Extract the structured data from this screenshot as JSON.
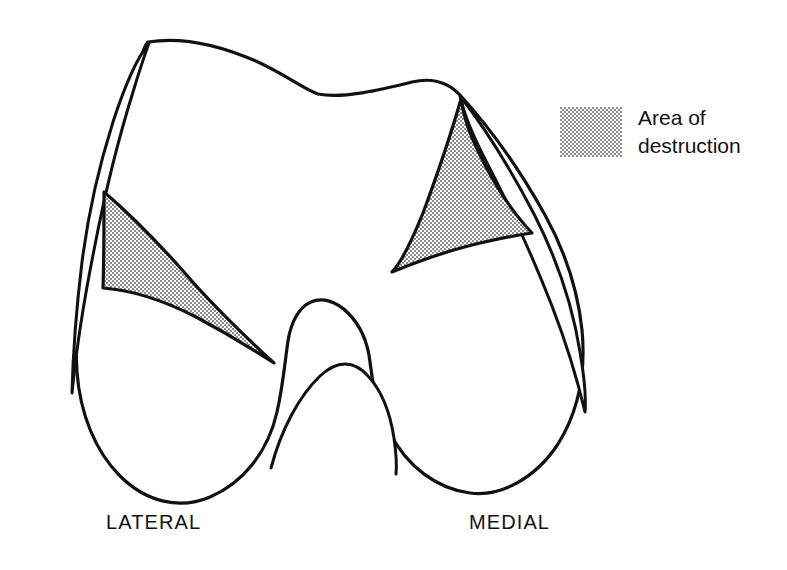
{
  "figure": {
    "kind": "anatomical-line-drawing",
    "background_color": "#ffffff",
    "line_color": "#111111",
    "stipple_color": "#8c8c8c"
  },
  "legend": {
    "swatch_name": "stipple-pattern-swatch",
    "swatch_fill": "#8c8c8c",
    "label_line1": "Area of",
    "label_line2": "destruction",
    "label": "Area of\ndestruction"
  },
  "labels": {
    "lateral": "LATERAL",
    "medial": "MEDIAL"
  },
  "regions": [
    {
      "name": "lateral-destruction-area",
      "side": "lateral",
      "shading": "stipple"
    },
    {
      "name": "medial-destruction-area",
      "side": "medial",
      "shading": "stipple"
    }
  ]
}
